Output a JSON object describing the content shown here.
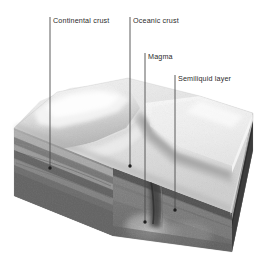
{
  "figure": {
    "style": "grayscale airbrush geological block diagram",
    "background_color": "#ffffff",
    "label_color": "#2b2b2b",
    "leader_line_color": "#4a4a4a",
    "callouts": [
      {
        "id": "continental-crust",
        "label": "Continental crust",
        "text_x": 53,
        "text_y": 16,
        "line_x": 50,
        "line_top": 17,
        "line_bottom": 168,
        "dot_x": 50,
        "dot_y": 168
      },
      {
        "id": "oceanic-crust",
        "label": "Oceanic crust",
        "text_x": 133,
        "text_y": 16,
        "line_x": 130,
        "line_top": 17,
        "line_bottom": 166,
        "dot_x": 130,
        "dot_y": 166
      },
      {
        "id": "magma",
        "label": "Magma",
        "text_x": 148,
        "text_y": 52,
        "line_x": 145,
        "line_top": 53,
        "line_bottom": 222,
        "dot_x": 145,
        "dot_y": 222
      },
      {
        "id": "semiliquid-layer",
        "label": "Semiliquid layer",
        "text_x": 178,
        "text_y": 74,
        "line_x": 175,
        "line_top": 75,
        "line_bottom": 210,
        "dot_x": 175,
        "dot_y": 210
      }
    ],
    "block": {
      "top_surface_color": "#e9e9e9",
      "left_face_color": "#9a9a9a",
      "front_face_color": "#6e6e6e",
      "deep_mantle_color": "#585858",
      "strata_band_colors": [
        "#bdbdbd",
        "#8e8e8e",
        "#707070",
        "#555555",
        "#444444"
      ],
      "features": [
        "continental mountain ridge",
        "oceanic plate slab",
        "subduction trench",
        "rising magma plume",
        "semiliquid asthenosphere layer"
      ]
    }
  }
}
